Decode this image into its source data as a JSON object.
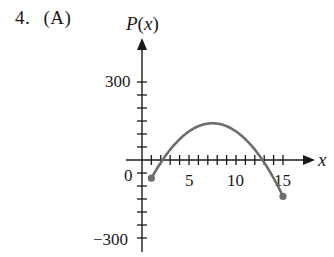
{
  "problem": {
    "number": "4.",
    "choice": "(A)"
  },
  "chart_data": {
    "type": "line",
    "title": "",
    "xlabel": "x",
    "ylabel": "P(x)",
    "ylabel_parts": {
      "func": "P",
      "open": "(",
      "var": "x",
      "close": ")"
    },
    "x_tick_labels": [
      "5",
      "10",
      "15"
    ],
    "x_tick_values": [
      5,
      10,
      15
    ],
    "x_minor_ticks": [
      1,
      2,
      3,
      4,
      5,
      6,
      7,
      8,
      9,
      10,
      11,
      12,
      13,
      14,
      15
    ],
    "y_tick_labels": [
      "300",
      "0",
      "−300"
    ],
    "y_tick_values": [
      300,
      0,
      -300
    ],
    "y_minor_step": 50,
    "xlim": [
      0,
      18
    ],
    "ylim": [
      -330,
      390
    ],
    "grid": false,
    "legend": null,
    "curve_description": "Downward parabola on [1, 15] with closed endpoints",
    "series": [
      {
        "name": "P(x)",
        "color": "#6e6e6e",
        "x": [
          1,
          2,
          3,
          4,
          5,
          6,
          7,
          7.5,
          8,
          9,
          10,
          11,
          12,
          13,
          14,
          15
        ],
        "y": [
          -70,
          0,
          40,
          80,
          110,
          130,
          140,
          141.25,
          140,
          130,
          110,
          80,
          40,
          -10,
          -70,
          -140
        ]
      }
    ],
    "endpoints": [
      {
        "x": 1,
        "y": -70,
        "closed": true
      },
      {
        "x": 15,
        "y": -140,
        "closed": true
      }
    ]
  },
  "colors": {
    "axis": "#1a1a1a",
    "curve": "#6e6e6e",
    "background": "#ffffff"
  }
}
